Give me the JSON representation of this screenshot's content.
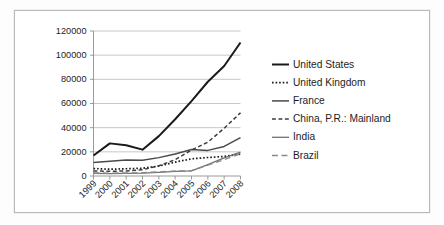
{
  "figure": {
    "kind": "line-chart-figure",
    "background_color": "#ffffff",
    "frame_color": "#b9b9b9"
  },
  "chart_data": {
    "type": "line",
    "title": "",
    "subtitle": "",
    "xlabel": "",
    "ylabel": "",
    "categories": [
      "1999",
      "2000",
      "2001",
      "2002",
      "2003",
      "2004",
      "2005",
      "2006",
      "2007",
      "2008"
    ],
    "x": [
      1999,
      2000,
      2001,
      2002,
      2003,
      2004,
      2005,
      2006,
      2007,
      2008
    ],
    "ylim": [
      0,
      120000
    ],
    "xlim": [
      1999,
      2008
    ],
    "y_ticks": [
      0,
      20000,
      40000,
      60000,
      80000,
      100000,
      120000
    ],
    "y_tick_labels": [
      "0",
      "20000",
      "40000",
      "60000",
      "80000",
      "100000",
      "120000"
    ],
    "grid": true,
    "grid_axis": "y",
    "legend_position": "right",
    "x_tick_rotation": -45,
    "series": [
      {
        "name": "United States",
        "values": [
          17000,
          27000,
          25500,
          21800,
          33000,
          47000,
          62000,
          78000,
          91000,
          110500
        ],
        "color": "#1a1a1a",
        "line_style": "solid",
        "line_width": 2.0
      },
      {
        "name": "United Kingdom",
        "values": [
          6200,
          5600,
          6000,
          6400,
          8200,
          11500,
          14200,
          15300,
          16200,
          18200
        ],
        "color": "#1a1a1a",
        "line_style": "dotted",
        "line_width": 1.7
      },
      {
        "name": "France",
        "values": [
          11200,
          12300,
          13200,
          13000,
          15200,
          18200,
          22000,
          21200,
          24500,
          31800
        ],
        "color": "#4a4a4a",
        "line_style": "solid",
        "line_width": 1.5
      },
      {
        "name": "China, P.R.: Mainland",
        "values": [
          4200,
          3900,
          4200,
          5200,
          8500,
          13500,
          21500,
          28000,
          39500,
          52300
        ],
        "color": "#3d3d3d",
        "line_style": "dashed",
        "line_width": 1.5
      },
      {
        "name": "India",
        "values": [
          2100,
          2000,
          2100,
          2300,
          3000,
          3800,
          4300,
          9500,
          15000,
          19800
        ],
        "color": "#707070",
        "line_style": "solid",
        "line_width": 1.3
      },
      {
        "name": "Brazil",
        "values": [
          2600,
          2400,
          2500,
          2700,
          3400,
          4100,
          4400,
          9000,
          13500,
          18500
        ],
        "color": "#8a8a8a",
        "line_style": "longdash",
        "line_width": 1.4
      }
    ]
  },
  "legend": {
    "items": [
      {
        "label": "United States"
      },
      {
        "label": "United Kingdom"
      },
      {
        "label": "France"
      },
      {
        "label": "China, P.R.: Mainland"
      },
      {
        "label": "India"
      },
      {
        "label": "Brazil"
      }
    ]
  }
}
